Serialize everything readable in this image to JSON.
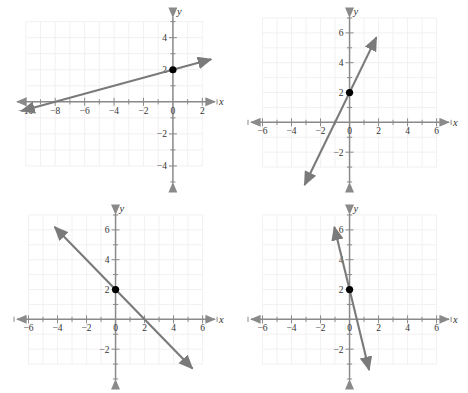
{
  "figure": {
    "background_color": "#ffffff",
    "line_color": "#7a7a7a",
    "axis_color": "#8a8a8a",
    "grid_color": "#f2eef0",
    "point_color": "#000000",
    "panel_count": 4
  },
  "chart_data": [
    {
      "id": "panel-top-left",
      "type": "line",
      "title": "",
      "xlabel": "x",
      "ylabel": "y",
      "xlim": [
        -10.8,
        3.2
      ],
      "ylim": [
        -5.0,
        5.6
      ],
      "xticks": [
        -10,
        -8,
        -6,
        -4,
        -2,
        0,
        2
      ],
      "yticks": [
        4,
        2,
        -2,
        -4
      ],
      "xtick_labels": [
        "-10",
        "-8",
        "-6",
        "-4",
        "-2",
        "0",
        "2"
      ],
      "ytick_labels": [
        "4",
        "2",
        "-2",
        "-4"
      ],
      "minor_tick_step": 1,
      "grid": true,
      "grid_xrange": [
        -10,
        2
      ],
      "grid_yrange": [
        -4,
        5
      ],
      "legend": "none",
      "series": [
        {
          "name": "line-1",
          "slope": 0.25,
          "intercept": 2,
          "x_intercept": -8,
          "equation": "y = 0.25x + 2",
          "x_start": -10.3,
          "x_end": 2.6,
          "arrow_start": true,
          "arrow_end": true
        }
      ],
      "points": [
        {
          "label": "y-intercept",
          "x": 0,
          "y": 2
        }
      ]
    },
    {
      "id": "panel-top-right",
      "type": "line",
      "title": "",
      "xlabel": "x",
      "ylabel": "y",
      "xlim": [
        -7.0,
        7.2
      ],
      "ylim": [
        -4.0,
        7.4
      ],
      "xticks": [
        -6,
        -4,
        -2,
        0,
        2,
        4,
        6
      ],
      "yticks": [
        6,
        4,
        2,
        -2
      ],
      "xtick_labels": [
        "-6",
        "-4",
        "-2",
        "0",
        "2",
        "4",
        "6"
      ],
      "ytick_labels": [
        "6",
        "4",
        "2",
        "-2"
      ],
      "minor_tick_step": 1,
      "grid": true,
      "grid_xrange": [
        -6,
        6
      ],
      "grid_yrange": [
        -3,
        7
      ],
      "legend": "none",
      "series": [
        {
          "name": "line-1",
          "slope": 2,
          "intercept": 2,
          "x_intercept": -1,
          "equation": "y = 2x + 2",
          "x_start": -3.1,
          "x_end": 1.85,
          "arrow_start": true,
          "arrow_end": true
        }
      ],
      "points": [
        {
          "label": "y-intercept",
          "x": 0,
          "y": 2
        }
      ]
    },
    {
      "id": "panel-bottom-left",
      "type": "line",
      "title": "",
      "xlabel": "x",
      "ylabel": "y",
      "xlim": [
        -7.0,
        7.2
      ],
      "ylim": [
        -4.0,
        7.4
      ],
      "xticks": [
        -6,
        -4,
        -2,
        0,
        2,
        4,
        6
      ],
      "yticks": [
        6,
        4,
        2,
        -2
      ],
      "xtick_labels": [
        "-6",
        "-4",
        "-2",
        "0",
        "2",
        "4",
        "6"
      ],
      "ytick_labels": [
        "6",
        "4",
        "2",
        "-2"
      ],
      "minor_tick_step": 1,
      "grid": true,
      "grid_xrange": [
        -6,
        6
      ],
      "grid_yrange": [
        -3,
        7
      ],
      "legend": "none",
      "series": [
        {
          "name": "line-1",
          "slope": -1,
          "intercept": 2,
          "x_intercept": 2,
          "equation": "y = -x + 2",
          "x_start": -4.2,
          "x_end": 5.3,
          "arrow_start": true,
          "arrow_end": true
        }
      ],
      "points": [
        {
          "label": "y-intercept",
          "x": 0,
          "y": 2
        }
      ]
    },
    {
      "id": "panel-bottom-right",
      "type": "line",
      "title": "",
      "xlabel": "x",
      "ylabel": "y",
      "xlim": [
        -7.0,
        7.2
      ],
      "ylim": [
        -4.0,
        7.4
      ],
      "xticks": [
        -6,
        -4,
        -2,
        0,
        2,
        4,
        6
      ],
      "yticks": [
        6,
        4,
        2,
        -2
      ],
      "xtick_labels": [
        "-6",
        "-4",
        "-2",
        "0",
        "2",
        "4",
        "6"
      ],
      "ytick_labels": [
        "6",
        "4",
        "2",
        "-2"
      ],
      "minor_tick_step": 1,
      "grid": true,
      "grid_xrange": [
        -6,
        6
      ],
      "grid_yrange": [
        -3,
        7
      ],
      "legend": "none",
      "series": [
        {
          "name": "line-1",
          "slope": -4,
          "intercept": 2,
          "x_intercept": 0.5,
          "equation": "y = -4x + 2",
          "x_start": -1.05,
          "x_end": 1.35,
          "arrow_start": true,
          "arrow_end": true
        }
      ],
      "points": [
        {
          "label": "y-intercept",
          "x": 0,
          "y": 2
        }
      ]
    }
  ]
}
